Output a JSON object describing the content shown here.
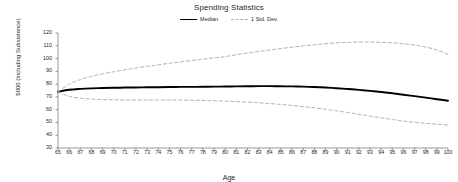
{
  "chart": {
    "title": "Spending Statistics",
    "xlabel": "Age",
    "ylabel": "$000 (Including Subsistence)"
  },
  "legend": {
    "position": "top-center",
    "items": [
      {
        "label": "Median",
        "style": "solid",
        "color": "#000000",
        "icon": "solid-line-swatch"
      },
      {
        "label": "1 Std. Dev.",
        "style": "dashed",
        "color": "#b0b0b0",
        "icon": "dashed-line-swatch"
      }
    ]
  },
  "chart_data": {
    "type": "line",
    "title": "Spending Statistics",
    "xlabel": "Age",
    "ylabel": "$000 (Including Subsistence)",
    "xlim": [
      65,
      100
    ],
    "ylim": [
      30,
      120
    ],
    "grid": false,
    "legend_position": "top-center",
    "x": [
      65,
      66,
      67,
      68,
      69,
      70,
      71,
      72,
      73,
      74,
      75,
      76,
      77,
      78,
      79,
      80,
      81,
      82,
      83,
      84,
      85,
      86,
      87,
      88,
      89,
      90,
      91,
      92,
      93,
      94,
      95,
      96,
      97,
      98,
      99,
      100
    ],
    "xticks": [
      "65",
      "66",
      "67",
      "68",
      "69",
      "70",
      "71",
      "72",
      "73",
      "74",
      "75",
      "76",
      "77",
      "78",
      "79",
      "80",
      "81",
      "82",
      "83",
      "84",
      "85",
      "86",
      "87",
      "88",
      "89",
      "90",
      "91",
      "92",
      "93",
      "94",
      "95",
      "96",
      "97",
      "98",
      "99",
      "100"
    ],
    "yticks": [
      "30",
      "40",
      "50",
      "60",
      "70",
      "80",
      "90",
      "100",
      "110",
      "120"
    ],
    "series": [
      {
        "name": "Median",
        "style": "solid",
        "color": "#000000",
        "values": [
          74.0,
          75.6,
          76.3,
          76.7,
          76.9,
          77.1,
          77.3,
          77.4,
          77.5,
          77.6,
          77.7,
          77.8,
          77.8,
          77.9,
          78.0,
          78.1,
          78.2,
          78.3,
          78.4,
          78.4,
          78.3,
          78.2,
          78.0,
          77.7,
          77.3,
          76.8,
          76.2,
          75.5,
          74.7,
          73.8,
          72.8,
          71.7,
          70.6,
          69.4,
          68.2,
          67.0
        ]
      },
      {
        "name": "1 Std. Dev. (upper)",
        "style": "dashed",
        "color": "#b0b0b0",
        "values": [
          74.0,
          80.0,
          83.5,
          86.0,
          88.0,
          89.7,
          91.2,
          92.6,
          93.9,
          95.1,
          96.3,
          97.4,
          98.5,
          99.5,
          100.5,
          101.5,
          103.0,
          104.3,
          105.5,
          106.7,
          107.8,
          108.9,
          109.9,
          110.8,
          111.6,
          112.3,
          112.7,
          112.9,
          112.9,
          112.7,
          112.3,
          111.6,
          110.6,
          109.0,
          106.7,
          103.3
        ]
      },
      {
        "name": "1 Std. Dev. (lower)",
        "style": "dashed",
        "color": "#b0b0b0",
        "values": [
          74.0,
          70.5,
          69.0,
          68.3,
          67.9,
          67.7,
          67.6,
          67.6,
          67.6,
          67.6,
          67.6,
          67.5,
          67.4,
          67.2,
          67.0,
          66.7,
          66.3,
          65.9,
          65.4,
          64.8,
          64.1,
          63.3,
          62.4,
          61.4,
          60.3,
          59.1,
          57.8,
          56.4,
          55.0,
          53.6,
          52.3,
          51.1,
          50.1,
          49.3,
          48.6,
          48.0
        ]
      }
    ]
  }
}
